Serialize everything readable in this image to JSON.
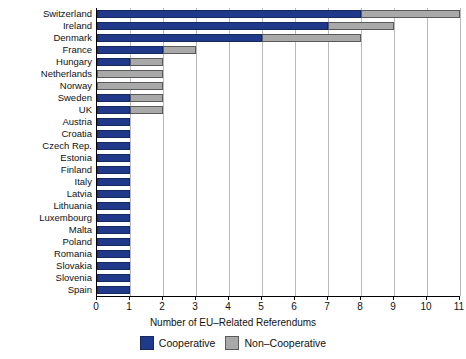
{
  "chart_data": {
    "type": "bar",
    "orientation": "horizontal",
    "stacked": true,
    "title": "",
    "xlabel": "Number of EU–Related Referendums",
    "ylabel": "",
    "xlim": [
      0,
      11
    ],
    "xticks": [
      0,
      1,
      2,
      3,
      4,
      5,
      6,
      7,
      8,
      9,
      10,
      11
    ],
    "xticklabels": [
      "0",
      "1",
      "2",
      "3",
      "4",
      "5",
      "6",
      "7",
      "8",
      "9",
      "10",
      "11"
    ],
    "grid": true,
    "grid_axis": "x",
    "legend_position": "bottom",
    "categories": [
      "Switzerland",
      "Ireland",
      "Denmark",
      "France",
      "Hungary",
      "Netherlands",
      "Norway",
      "Sweden",
      "UK",
      "Austria",
      "Croatia",
      "Czech Rep.",
      "Estonia",
      "Finland",
      "Italy",
      "Latvia",
      "Lithuania",
      "Luxembourg",
      "Malta",
      "Poland",
      "Romania",
      "Slovakia",
      "Slovenia",
      "Spain"
    ],
    "series": [
      {
        "name": "Cooperative",
        "color": "#1f3a8a",
        "values": [
          8,
          7,
          5,
          2,
          1,
          0,
          0,
          1,
          1,
          1,
          1,
          1,
          1,
          1,
          1,
          1,
          1,
          1,
          1,
          1,
          1,
          1,
          1,
          1
        ]
      },
      {
        "name": "Non-Cooperative",
        "color": "#a9a9a9",
        "values": [
          3,
          2,
          3,
          1,
          1,
          2,
          2,
          1,
          1,
          0,
          0,
          0,
          0,
          0,
          0,
          0,
          0,
          0,
          0,
          0,
          0,
          0,
          0,
          0
        ]
      }
    ],
    "totals": [
      11,
      9,
      8,
      3,
      2,
      2,
      2,
      2,
      2,
      1,
      1,
      1,
      1,
      1,
      1,
      1,
      1,
      1,
      1,
      1,
      1,
      1,
      1,
      1
    ]
  },
  "legend": {
    "items": [
      {
        "label": "Cooperative",
        "color": "#1f3a8a",
        "swatch": "legend-swatch-cooperative"
      },
      {
        "label": "Non–Cooperative",
        "color": "#a9a9a9",
        "swatch": "legend-swatch-non-cooperative"
      }
    ]
  },
  "colors": {
    "cooperative": "#1f3a8a",
    "non_cooperative": "#a9a9a9",
    "gridline": "#b9b9b9",
    "axis": "#000000",
    "background": "#ffffff"
  }
}
